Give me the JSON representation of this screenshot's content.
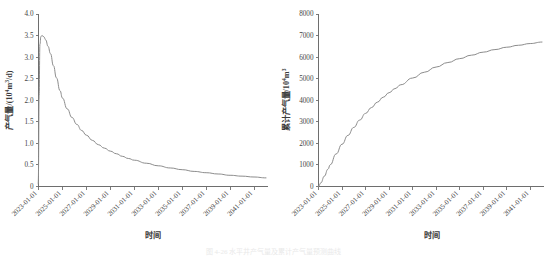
{
  "figure": {
    "background": "#ffffff",
    "caption": "图 4-26  水平井产气量及累计产气量预测曲线",
    "curve_color": "#8c8c8c",
    "axis_color": "#6e6e6e"
  },
  "chart_data": [
    {
      "id": "gas-rate",
      "type": "line",
      "title": "",
      "xlabel": "时间",
      "ylabel": "产气量/(10⁴m³/d)",
      "ylabel_parts": {
        "base": "产气量/(10",
        "sup": "4",
        "tail": "m",
        "sup2": "3",
        "tail2": "/d)"
      },
      "grid": false,
      "legend": "none",
      "ylim": [
        0,
        4.0
      ],
      "yticks": [
        "0",
        "0.5",
        "1.0",
        "1.5",
        "2.0",
        "2.5",
        "3.0",
        "3.5",
        "4.0"
      ],
      "ytick_values": [
        0,
        0.5,
        1.0,
        1.5,
        2.0,
        2.5,
        3.0,
        3.5,
        4.0
      ],
      "xlim": [
        2023.0,
        2042.0
      ],
      "xticks": [
        "2023-01-01",
        "2025-01-01",
        "2027-01-01",
        "2029-01-01",
        "2031-01-01",
        "2033-01-01",
        "2035-01-01",
        "2037-01-01",
        "2039-01-01",
        "2041-01-01"
      ],
      "xtick_values": [
        2023,
        2025,
        2027,
        2029,
        2031,
        2033,
        2035,
        2037,
        2039,
        2041
      ],
      "x": [
        2023.0,
        2023.05,
        2023.12,
        2023.2,
        2023.3,
        2023.45,
        2023.6,
        2023.8,
        2024.0,
        2024.25,
        2024.5,
        2024.8,
        2025.0,
        2025.4,
        2025.8,
        2026.2,
        2026.6,
        2027.0,
        2027.5,
        2028.0,
        2028.5,
        2029.0,
        2029.5,
        2030.0,
        2030.5,
        2031.0,
        2032.0,
        2033.0,
        2034.0,
        2035.0,
        2036.0,
        2037.0,
        2038.0,
        2039.0,
        2040.0,
        2041.0,
        2042.0
      ],
      "y": [
        0.05,
        2.1,
        3.3,
        3.48,
        3.5,
        3.47,
        3.4,
        3.25,
        3.08,
        2.8,
        2.52,
        2.22,
        2.05,
        1.8,
        1.6,
        1.44,
        1.3,
        1.19,
        1.07,
        0.97,
        0.89,
        0.82,
        0.76,
        0.7,
        0.65,
        0.61,
        0.54,
        0.48,
        0.43,
        0.39,
        0.35,
        0.32,
        0.29,
        0.26,
        0.24,
        0.22,
        0.2
      ],
      "peak_value": 3.5,
      "end_value": 0.2
    },
    {
      "id": "cumulative-gas",
      "type": "line",
      "title": "",
      "xlabel": "时间",
      "ylabel": "累计产气量/10⁴m³",
      "ylabel_parts": {
        "base": "累计产气量/10",
        "sup": "4",
        "tail": "m",
        "sup2": "3"
      },
      "grid": false,
      "legend": "none",
      "ylim": [
        0,
        8000
      ],
      "yticks": [
        "0",
        "1000",
        "2000",
        "3000",
        "4000",
        "5000",
        "6000",
        "7000",
        "8000"
      ],
      "ytick_values": [
        0,
        1000,
        2000,
        3000,
        4000,
        5000,
        6000,
        7000,
        8000
      ],
      "xlim": [
        2023.0,
        2042.0
      ],
      "xticks": [
        "2023-01-01",
        "2025-01-01",
        "2027-01-01",
        "2029-01-01",
        "2031-01-01",
        "2033-01-01",
        "2035-01-01",
        "2037-01-01",
        "2039-01-01",
        "2041-01-01"
      ],
      "xtick_values": [
        2023,
        2025,
        2027,
        2029,
        2031,
        2033,
        2035,
        2037,
        2039,
        2041
      ],
      "x": [
        2023.0,
        2023.2,
        2023.5,
        2023.8,
        2024.0,
        2024.5,
        2025.0,
        2025.5,
        2026.0,
        2026.5,
        2027.0,
        2027.5,
        2028.0,
        2028.5,
        2029.0,
        2029.5,
        2030.0,
        2031.0,
        2032.0,
        2033.0,
        2034.0,
        2035.0,
        2036.0,
        2037.0,
        2038.0,
        2039.0,
        2040.0,
        2041.0,
        2042.0
      ],
      "y": [
        0,
        170,
        480,
        800,
        1010,
        1510,
        1960,
        2370,
        2740,
        3080,
        3390,
        3660,
        3910,
        4140,
        4350,
        4540,
        4720,
        5030,
        5300,
        5540,
        5750,
        5930,
        6090,
        6230,
        6350,
        6460,
        6550,
        6630,
        6700
      ],
      "end_value": 6700
    }
  ]
}
